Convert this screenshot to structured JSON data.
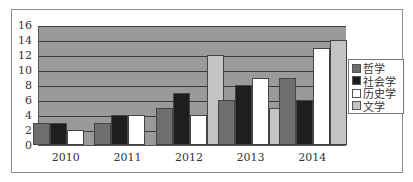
{
  "chart_data": {
    "type": "bar",
    "title": "",
    "xlabel": "",
    "ylabel": "",
    "categories": [
      "2010",
      "2011",
      "2012",
      "2013",
      "2014"
    ],
    "series": [
      {
        "name": "哲学",
        "color": "#6e6e6e",
        "values": [
          3,
          3,
          5,
          6,
          9
        ]
      },
      {
        "name": "社会学",
        "color": "#1e1e1e",
        "values": [
          3,
          4,
          7,
          8,
          6
        ]
      },
      {
        "name": "历史学",
        "color": "#ffffff",
        "values": [
          2,
          4,
          4,
          9,
          13
        ]
      },
      {
        "name": "文学",
        "color": "#c4c4c4",
        "values": [
          0,
          0,
          12,
          5,
          14
        ]
      }
    ],
    "ylim": [
      0,
      16
    ],
    "yticks": [
      "0",
      "2",
      "4",
      "6",
      "8",
      "10",
      "12",
      "14",
      "16"
    ],
    "grid": true,
    "legend_position": "right",
    "plot_background": "#9a9a9a"
  }
}
